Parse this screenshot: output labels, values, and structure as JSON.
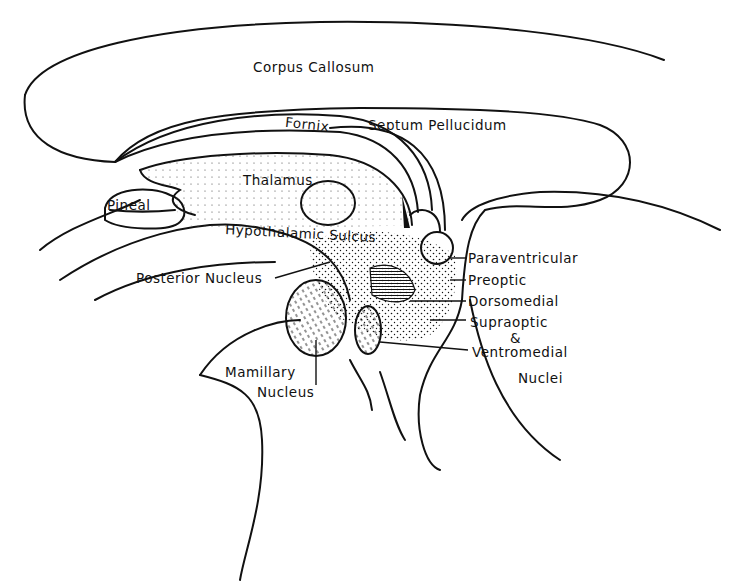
{
  "diagram": {
    "type": "anatomical sagittal section",
    "labels": {
      "corpus_callosum": "Corpus Callosum",
      "fornix": "Fornix",
      "septum_pellucidum": "Septum Pellucidum",
      "thalamus": "Thalamus",
      "pineal": "Pineal",
      "hypothalamic_sulcus": "Hypothalamic Sulcus",
      "posterior_nucleus": "Posterior Nucleus",
      "paraventricular": "Paraventricular",
      "preoptic": "Preoptic",
      "dorsomedial": "Dorsomedial",
      "supraoptic": "Supraoptic",
      "ampersand": "&",
      "ventromedial": "Ventromedial",
      "nuclei": "Nuclei",
      "mamillary": "Mamillary",
      "nucleus": "Nucleus"
    },
    "colors": {
      "ink": "#111111",
      "background": "#ffffff"
    }
  }
}
